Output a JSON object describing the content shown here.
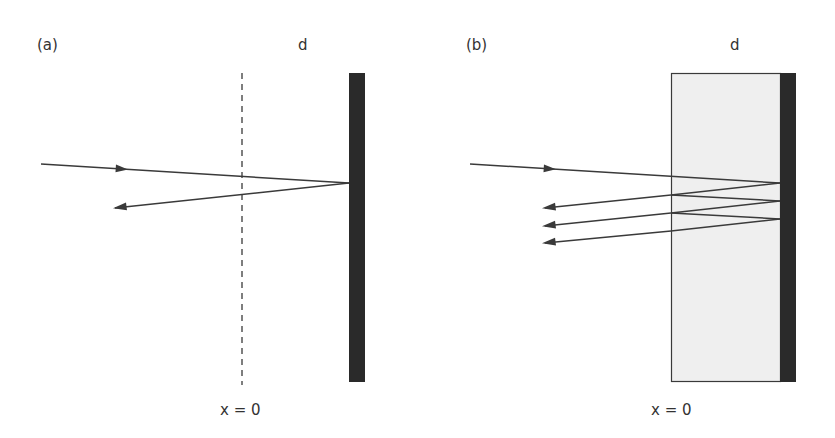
{
  "panel_a": {
    "label": "(a)",
    "top_label": "d",
    "bottom_label": "x = 0"
  },
  "panel_b": {
    "label": "(b)",
    "top_label": "d",
    "bottom_label": "x = 0"
  },
  "colors": {
    "mirror": "#2a2a2a",
    "slab_fill": "#efefef",
    "line": "#3a3a3a"
  }
}
